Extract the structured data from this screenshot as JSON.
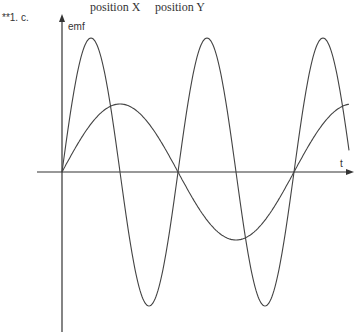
{
  "question_label": "**1. c.",
  "markers": {
    "x_label": "position X",
    "y_label": "position Y"
  },
  "axes": {
    "y_label": "emf",
    "x_label": "t"
  },
  "chart_data": {
    "type": "line",
    "title": "",
    "xlabel": "t",
    "ylabel": "emf",
    "annotations": [
      "position X",
      "position Y"
    ],
    "series": [
      {
        "name": "large amplitude (high frequency)",
        "amplitude": 1.0,
        "periods_shown": 2.5,
        "description": "sine with 2.5 cycles, peaks at top"
      },
      {
        "name": "small amplitude (low frequency)",
        "amplitude": 0.5,
        "periods_shown": 1.25,
        "description": "sine with 1.25 cycles"
      }
    ],
    "grid": false
  },
  "colors": {
    "line": "#333333"
  }
}
